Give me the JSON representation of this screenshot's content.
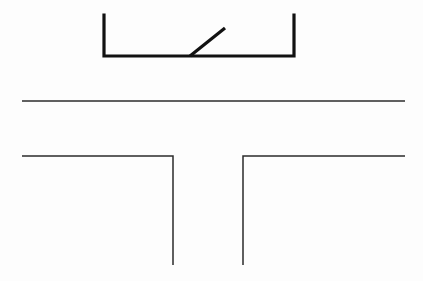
{
  "canvas": {
    "width": 423,
    "height": 281,
    "background_color": "#fdfdfd",
    "description": "black-and-white technical line drawing"
  },
  "colors": {
    "thick_stroke": "#111111",
    "thin_stroke": "#2b2b2b",
    "background": "#fdfdfd"
  },
  "strokes": {
    "thick_width": 3.2,
    "thin_width": 1.5
  },
  "shapes": {
    "bracket": {
      "name": "open-channel-bracket",
      "stroke_color": "#111111",
      "stroke_width": 3.2,
      "points": [
        [
          104,
          15
        ],
        [
          104,
          56
        ],
        [
          294,
          56
        ],
        [
          294,
          15
        ]
      ]
    },
    "diagonal": {
      "name": "diagonal-segment",
      "stroke_color": "#111111",
      "stroke_width": 3.2,
      "x1": 190,
      "y1": 56,
      "x2": 225,
      "y2": 28
    },
    "middle_rule": {
      "name": "horizontal-rule",
      "stroke_color": "#2b2b2b",
      "stroke_width": 1.5,
      "x1": 22,
      "y1": 101,
      "x2": 405,
      "y2": 101
    },
    "left_tee": {
      "name": "left-tee-arm",
      "stroke_color": "#2b2b2b",
      "stroke_width": 1.5,
      "points": [
        [
          22,
          156
        ],
        [
          173,
          156
        ],
        [
          173,
          265
        ]
      ]
    },
    "right_tee": {
      "name": "right-tee-arm",
      "stroke_color": "#2b2b2b",
      "stroke_width": 1.5,
      "points": [
        [
          243,
          265
        ],
        [
          243,
          156
        ],
        [
          405,
          156
        ]
      ]
    }
  }
}
